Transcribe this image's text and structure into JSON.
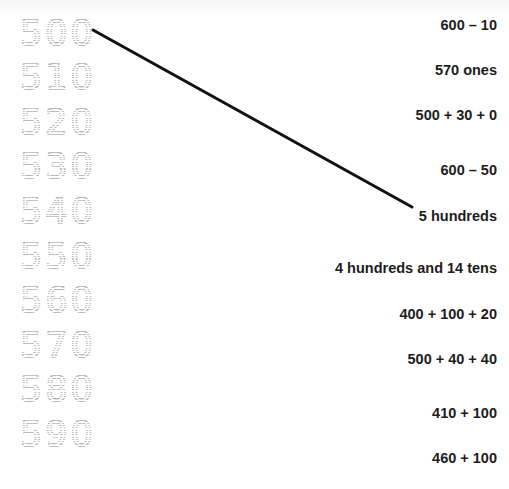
{
  "worksheet": {
    "background_color": "#ffffff",
    "trace_color": "#b9b9b9",
    "text_color": "#1c1c1c",
    "line_color": "#111111",
    "trace_numbers": [
      {
        "label": "500",
        "y": 15
      },
      {
        "label": "510",
        "y": 59
      },
      {
        "label": "520",
        "y": 104
      },
      {
        "label": "530",
        "y": 148
      },
      {
        "label": "540",
        "y": 193
      },
      {
        "label": "550",
        "y": 238
      },
      {
        "label": "560",
        "y": 282
      },
      {
        "label": "570",
        "y": 327
      },
      {
        "label": "580",
        "y": 371
      },
      {
        "label": "590",
        "y": 416
      }
    ],
    "answers": [
      {
        "label": "600 – 10",
        "y": 16
      },
      {
        "label": "570 ones",
        "y": 61
      },
      {
        "label": "500 + 30 + 0",
        "y": 106
      },
      {
        "label": "600 – 50",
        "y": 161
      },
      {
        "label": "5 hundreds",
        "y": 207
      },
      {
        "label": "4 hundreds and 14 tens",
        "y": 259
      },
      {
        "label": "400 + 100 + 20",
        "y": 305
      },
      {
        "label": "500 + 40 + 40",
        "y": 350
      },
      {
        "label": "410 + 100",
        "y": 404
      },
      {
        "label": "460 + 100",
        "y": 449
      }
    ],
    "match_line": {
      "x1": 93,
      "y1": 30,
      "x2": 412,
      "y2": 207,
      "stroke_width": 3
    }
  }
}
